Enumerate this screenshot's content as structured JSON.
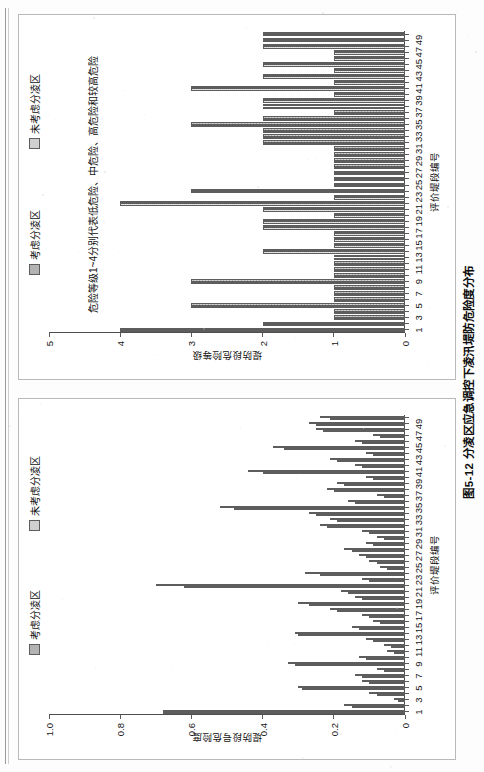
{
  "page": {
    "figure_caption": "图5-12  分凌区应急调控下凌汛堤防危险度分布"
  },
  "chart_data": [
    {
      "id": "chart-risk-degree",
      "type": "bar",
      "title": "",
      "xlabel": "评价堤段编号",
      "ylabel": "堤防段号危险度",
      "ylim": [
        0,
        1.0
      ],
      "ytick_labels": [
        "0",
        "0.2",
        "0.4",
        "0.6",
        "0.8",
        "1.0"
      ],
      "ytick_values": [
        0,
        0.2,
        0.4,
        0.6,
        0.8,
        1.0
      ],
      "grid": false,
      "legend_position": "top-right",
      "categories": [
        1,
        2,
        3,
        4,
        5,
        6,
        7,
        8,
        9,
        10,
        11,
        12,
        13,
        14,
        15,
        16,
        17,
        18,
        19,
        20,
        21,
        22,
        23,
        24,
        25,
        26,
        27,
        28,
        29,
        30,
        31,
        32,
        33,
        34,
        35,
        36,
        37,
        38,
        39,
        40,
        41,
        42,
        43,
        44,
        45,
        46,
        47,
        48,
        49,
        50
      ],
      "xtick_labels": [
        "1",
        "3",
        "5",
        "7",
        "9",
        "11",
        "13",
        "15",
        "17",
        "19",
        "21",
        "23",
        "25",
        "27",
        "29",
        "31",
        "33",
        "35",
        "37",
        "39",
        "41",
        "43",
        "45",
        "47",
        "49"
      ],
      "series": [
        {
          "name": "考虑分凌区",
          "color": "#b3b3b3",
          "values": [
            0.68,
            0.15,
            0.02,
            0.08,
            0.29,
            0.1,
            0.12,
            0.06,
            0.31,
            0.11,
            0.03,
            0.04,
            0.09,
            0.3,
            0.13,
            0.07,
            0.1,
            0.19,
            0.27,
            0.12,
            0.16,
            0.62,
            0.1,
            0.24,
            0.05,
            0.08,
            0.11,
            0.15,
            0.09,
            0.06,
            0.1,
            0.22,
            0.19,
            0.25,
            0.48,
            0.14,
            0.06,
            0.2,
            0.17,
            0.09,
            0.4,
            0.12,
            0.19,
            0.09,
            0.34,
            0.12,
            0.07,
            0.23,
            0.25,
            0.21
          ]
        },
        {
          "name": "未考虑分凌区",
          "color": "#cfcfcf",
          "values": [
            0.68,
            0.17,
            0.03,
            0.1,
            0.3,
            0.12,
            0.14,
            0.08,
            0.33,
            0.13,
            0.05,
            0.06,
            0.11,
            0.31,
            0.15,
            0.09,
            0.12,
            0.21,
            0.3,
            0.14,
            0.18,
            0.7,
            0.12,
            0.28,
            0.07,
            0.1,
            0.13,
            0.17,
            0.11,
            0.08,
            0.12,
            0.24,
            0.21,
            0.27,
            0.52,
            0.16,
            0.08,
            0.22,
            0.19,
            0.11,
            0.44,
            0.14,
            0.21,
            0.11,
            0.37,
            0.14,
            0.09,
            0.25,
            0.27,
            0.24
          ]
        }
      ]
    },
    {
      "id": "chart-risk-level",
      "type": "bar",
      "title": "",
      "xlabel": "评价堤段编号",
      "ylabel": "堤防段危险等级",
      "ylim": [
        0,
        5
      ],
      "ytick_labels": [
        "0",
        "1",
        "2",
        "3",
        "4",
        "5"
      ],
      "ytick_values": [
        0,
        1,
        2,
        3,
        4,
        5
      ],
      "grid": false,
      "legend_position": "top-right",
      "annotation": "危险等级1~4分别代表低危险、中危险、高危险和较高危险",
      "categories": [
        1,
        2,
        3,
        4,
        5,
        6,
        7,
        8,
        9,
        10,
        11,
        12,
        13,
        14,
        15,
        16,
        17,
        18,
        19,
        20,
        21,
        22,
        23,
        24,
        25,
        26,
        27,
        28,
        29,
        30,
        31,
        32,
        33,
        34,
        35,
        36,
        37,
        38,
        39,
        40,
        41,
        42,
        43,
        44,
        45,
        46,
        47,
        48,
        49,
        50
      ],
      "xtick_labels": [
        "1",
        "3",
        "5",
        "7",
        "9",
        "11",
        "13",
        "15",
        "17",
        "19",
        "21",
        "23",
        "25",
        "27",
        "29",
        "31",
        "33",
        "35",
        "37",
        "39",
        "41",
        "43",
        "45",
        "47",
        "49"
      ],
      "series": [
        {
          "name": "考虑分凌区",
          "color": "#b3b3b3",
          "values": [
            4,
            2,
            1,
            1,
            3,
            1,
            1,
            1,
            3,
            1,
            1,
            1,
            1,
            2,
            1,
            1,
            1,
            2,
            2,
            1,
            2,
            4,
            1,
            3,
            1,
            1,
            1,
            1,
            1,
            1,
            1,
            2,
            2,
            2,
            3,
            2,
            1,
            2,
            2,
            1,
            3,
            1,
            2,
            1,
            2,
            1,
            1,
            2,
            2,
            2
          ]
        },
        {
          "name": "未考虑分凌区",
          "color": "#cfcfcf",
          "values": [
            4,
            2,
            1,
            1,
            3,
            1,
            1,
            1,
            3,
            1,
            1,
            1,
            1,
            2,
            1,
            1,
            1,
            2,
            2,
            1,
            2,
            4,
            1,
            3,
            1,
            1,
            1,
            1,
            1,
            1,
            1,
            2,
            2,
            2,
            3,
            2,
            1,
            2,
            2,
            1,
            3,
            1,
            2,
            1,
            2,
            1,
            1,
            2,
            2,
            2
          ]
        }
      ]
    }
  ]
}
